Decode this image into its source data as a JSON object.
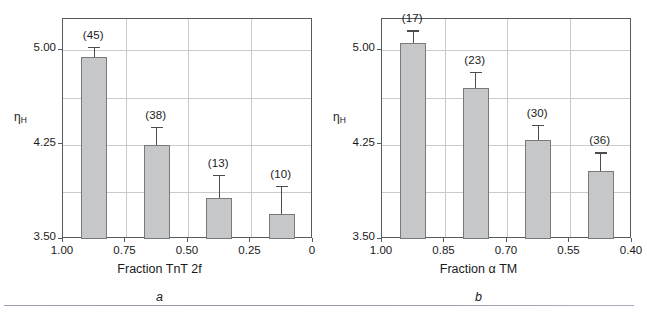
{
  "figure": {
    "footer_rule_color": "#9aa0b4",
    "bar_fill_color": "#c6c7c8",
    "bar_edge_color": "#77797b",
    "grid_color": "#c9cbcd",
    "axis_color": "#555a5e"
  },
  "chart_data": [
    {
      "type": "bar",
      "panel": "a",
      "caption": "a",
      "title": "",
      "xlabel": "Fraction TnT 2f",
      "ylabel": "ηH",
      "ylabel_base": "η",
      "ylabel_sub": "H",
      "categories": [
        "0.94",
        "0.68",
        "0.41",
        "0.16"
      ],
      "xticklabels": [
        "1.00",
        "0.75",
        "0.50",
        "0.25",
        "0"
      ],
      "xtickvalues": [
        1.0,
        0.75,
        0.5,
        0.25,
        0
      ],
      "yticklabels": [
        "5.00",
        "4.25",
        "3.50"
      ],
      "ytickvalues": [
        5.0,
        4.25,
        3.5
      ],
      "xlim": [
        1.0,
        0.0
      ],
      "ylim": [
        3.5,
        5.25
      ],
      "grid": true,
      "values": [
        4.95,
        4.25,
        3.83,
        3.7
      ],
      "errors": [
        0.08,
        0.14,
        0.18,
        0.22
      ],
      "annotations": [
        "(45)",
        "(38)",
        "(13)",
        "(10)"
      ]
    },
    {
      "type": "bar",
      "panel": "b",
      "caption": "b",
      "title": "",
      "xlabel": "Fraction α TM",
      "ylabel": "ηH",
      "ylabel_base": "η",
      "ylabel_sub": "H",
      "categories": [
        "0.96",
        "0.81",
        "0.66",
        "0.51"
      ],
      "xticklabels": [
        "1.00",
        "0.85",
        "0.70",
        "0.55",
        "0.40"
      ],
      "xtickvalues": [
        1.0,
        0.85,
        0.7,
        0.55,
        0.4
      ],
      "yticklabels": [
        "5.00",
        "4.25",
        "3.50"
      ],
      "ytickvalues": [
        5.0,
        4.25,
        3.5
      ],
      "xlim": [
        1.0,
        0.4
      ],
      "ylim": [
        3.5,
        5.25
      ],
      "grid": true,
      "values": [
        5.06,
        4.7,
        4.29,
        4.04
      ],
      "errors": [
        0.1,
        0.13,
        0.12,
        0.15
      ],
      "annotations": [
        "(17)",
        "(23)",
        "(30)",
        "(36)"
      ]
    }
  ]
}
